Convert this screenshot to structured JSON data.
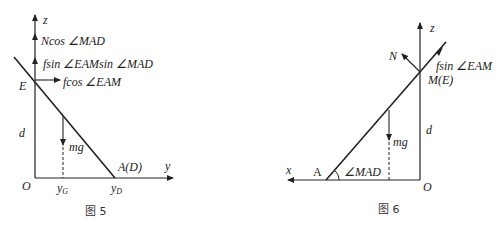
{
  "figures": [
    {
      "caption": "图 5",
      "axes": {
        "vertical": "z",
        "horizontal": "y",
        "origin": "O"
      },
      "points": {
        "E": "E",
        "AD": "A(D)"
      },
      "dimension": "d",
      "forces": {
        "normal_vertical": "Ncos ∠MAD",
        "friction_vertical": "fsin ∠EAMsin ∠MAD",
        "friction_horizontal": "fcos ∠EAM",
        "gravity": "mg"
      },
      "ticks": {
        "yG": "y",
        "yG_sub": "G",
        "yD": "y",
        "yD_sub": "D"
      }
    },
    {
      "caption": "图 6",
      "axes": {
        "vertical": "z",
        "horizontal": "x",
        "origin": "O"
      },
      "points": {
        "A": "A",
        "ME": "M(E)"
      },
      "dimension": "d",
      "angle": "∠MAD",
      "forces": {
        "normal": "N",
        "friction": "fsin ∠EAM",
        "gravity": "mg"
      }
    }
  ]
}
